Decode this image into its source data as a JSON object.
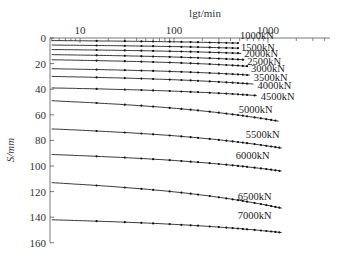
{
  "chart_data": {
    "type": "line",
    "title": "",
    "xlabel": "lgt/min",
    "ylabel": "S/mm",
    "x_scale": "log",
    "x_axis_position": "top",
    "x_ticks": [
      10,
      100,
      1000
    ],
    "x_tick_labels": [
      "10",
      "100",
      "1000"
    ],
    "y_ticks": [
      0,
      20,
      40,
      60,
      80,
      100,
      120,
      140,
      160
    ],
    "y_tick_labels": [
      "0",
      "20",
      "40",
      "60",
      "80",
      "100",
      "120",
      "140",
      "160"
    ],
    "ylim": [
      0,
      160
    ],
    "y_inverted": true,
    "grid": false,
    "legend": "inline labels at curve ends",
    "data_note": "Axis ticks and series labels are read from the image. Per-series t_end, s_start and s_end are approximate estimates tied to label positions, not traced pixel-by-pixel.",
    "series": [
      {
        "name": "1000kN",
        "t_end": 480,
        "s_start": 2,
        "s_end": 4
      },
      {
        "name": "1500kN",
        "t_end": 480,
        "s_start": 5.5,
        "s_end": 8
      },
      {
        "name": "2000kN",
        "t_end": 520,
        "s_start": 9,
        "s_end": 12
      },
      {
        "name": "2500kN",
        "t_end": 560,
        "s_start": 13,
        "s_end": 17
      },
      {
        "name": "3000kN",
        "t_end": 600,
        "s_start": 17,
        "s_end": 22
      },
      {
        "name": "3500kN",
        "t_end": 640,
        "s_start": 24,
        "s_end": 29
      },
      {
        "name": "4000kN",
        "t_end": 700,
        "s_start": 30,
        "s_end": 36
      },
      {
        "name": "4500kN",
        "t_end": 760,
        "s_start": 39,
        "s_end": 45
      },
      {
        "name": "5000kN",
        "t_end": 1300,
        "s_start": 49,
        "s_end": 65
      },
      {
        "name": "5500kN",
        "t_end": 1400,
        "s_start": 71,
        "s_end": 86
      },
      {
        "name": "6000kN",
        "t_end": 1400,
        "s_start": 91,
        "s_end": 104
      },
      {
        "name": "6500kN",
        "t_end": 1400,
        "s_start": 113,
        "s_end": 133
      },
      {
        "name": "7000kN",
        "t_end": 1400,
        "s_start": 142,
        "s_end": 152
      }
    ]
  }
}
